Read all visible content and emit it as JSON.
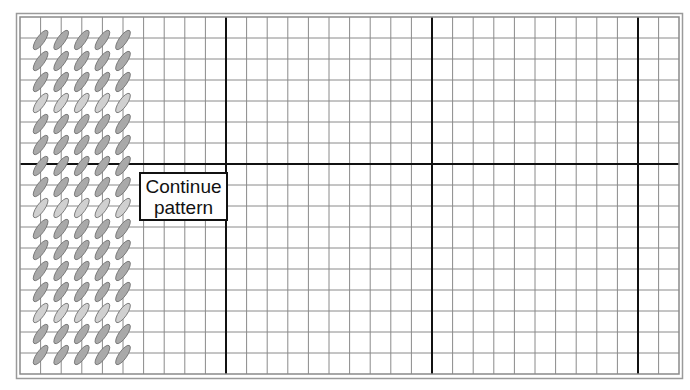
{
  "diagram": {
    "type": "stitch-chart",
    "grid": {
      "columns": 32,
      "rows": 17,
      "major_every": 10,
      "major_row_after": 7,
      "cell_width": 20.6,
      "cell_height": 21,
      "origin_x": 20,
      "origin_y": 17,
      "line_color": "#8a8a8a",
      "major_line_color": "#111111",
      "border_color": "#9a9a9a"
    },
    "stitches": {
      "columns": 5,
      "rows": 16,
      "shape": "slanted-ellipse",
      "dark_fill": "#a9a9a9",
      "light_fill": "#d0d0d0",
      "outline": "#6e6e6e",
      "light_rows": [
        3,
        8,
        13
      ]
    },
    "label": {
      "line1": "Continue",
      "line2": "pattern"
    }
  }
}
